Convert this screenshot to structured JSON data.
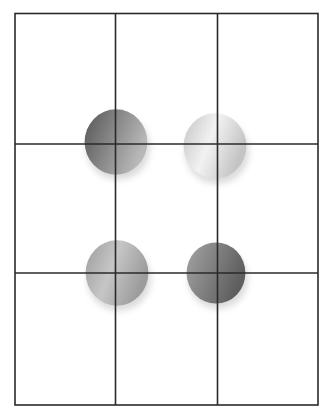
{
  "diagram": {
    "type": "rule-of-thirds-grid",
    "grid": {
      "left": 15,
      "top": 13.5,
      "right": 318,
      "bottom": 405,
      "vertical_lines": [
        115.5,
        217.5
      ],
      "horizontal_lines": [
        144,
        273
      ],
      "rows": 3,
      "cols": 3,
      "line_color": "#2a2a2a"
    },
    "spheres": [
      {
        "id": "top-left",
        "cx": 116,
        "cy": 142,
        "r": 32,
        "light": "#b8b8b8",
        "dark": "#555555",
        "shade": "dark"
      },
      {
        "id": "top-right",
        "cx": 215,
        "cy": 146,
        "r": 32,
        "light": "#f2f2f2",
        "dark": "#c4c4c4",
        "shade": "light"
      },
      {
        "id": "bottom-left",
        "cx": 117,
        "cy": 273,
        "r": 32,
        "light": "#c6c6c6",
        "dark": "#9c9c9c",
        "shade": "medium-light"
      },
      {
        "id": "bottom-right",
        "cx": 216,
        "cy": 273,
        "r": 30,
        "light": "#a4a4a4",
        "dark": "#5e5e5e",
        "shade": "medium-dark"
      }
    ]
  }
}
